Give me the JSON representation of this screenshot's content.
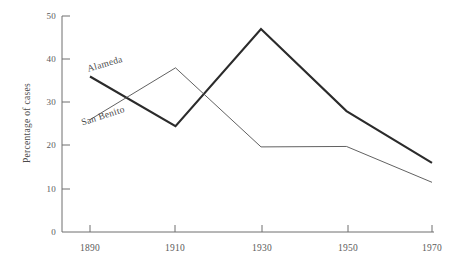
{
  "chart_data": {
    "type": "line",
    "title": "",
    "subtitle": "",
    "xlabel": "",
    "ylabel": "Percentage of cases",
    "x": [
      1890,
      1910,
      1930,
      1950,
      1970
    ],
    "xtick_labels": [
      "1890",
      "1910",
      "1930",
      "1950",
      "1970"
    ],
    "ytick_labels": [
      "0",
      "10",
      "20",
      "30",
      "40",
      "50"
    ],
    "ytick_values": [
      0,
      10,
      20,
      30,
      40,
      50
    ],
    "xlim": [
      1890,
      1970
    ],
    "ylim": [
      0,
      50
    ],
    "grid": false,
    "legend_position": "inline-annotation",
    "series": [
      {
        "name": "Alameda",
        "values": [
          36,
          24.5,
          47,
          28,
          16
        ],
        "color": "#2b2b2b",
        "line_width": 2.1,
        "label_text": "Alameda"
      },
      {
        "name": "San Benito",
        "values": [
          26,
          38,
          19.7,
          19.8,
          11.5
        ],
        "color": "#4f4f4f",
        "line_width": 0.9,
        "label_text": "San Benito"
      }
    ],
    "annotations": [
      {
        "text": "Alameda",
        "series": "Alameda",
        "rotation_deg": -16
      },
      {
        "text": "San Benito",
        "series": "San Benito",
        "rotation_deg": -18
      }
    ],
    "axis_color": "#6f6f6f"
  }
}
